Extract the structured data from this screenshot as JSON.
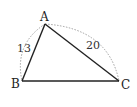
{
  "diagram": {
    "type": "triangle",
    "vertices": {
      "A": {
        "label": "A",
        "x": 45,
        "y": 24
      },
      "B": {
        "label": "B",
        "x": 22,
        "y": 81
      },
      "C": {
        "label": "C",
        "x": 119,
        "y": 81
      }
    },
    "sides": [
      {
        "from": "A",
        "to": "B",
        "length_label": "13",
        "marked_with": "dotted-arc"
      },
      {
        "from": "A",
        "to": "C",
        "length_label": "20",
        "marked_with": "dotted-arc"
      },
      {
        "from": "B",
        "to": "C",
        "length_label": ""
      }
    ],
    "colors": {
      "stroke": "#222222",
      "arc": "#999999"
    }
  }
}
